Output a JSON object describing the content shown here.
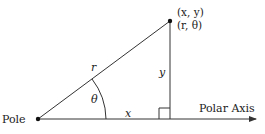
{
  "diagram": {
    "pole_label": "Pole",
    "axis_label": "Polar Axis",
    "point_rect_label": "(x, y)",
    "point_polar_label": "(r, θ)",
    "r_label": "r",
    "y_label": "y",
    "x_label": "x",
    "theta_label": "θ",
    "colors": {
      "line": "#333333",
      "text": "#222222",
      "background": "#ffffff"
    }
  }
}
